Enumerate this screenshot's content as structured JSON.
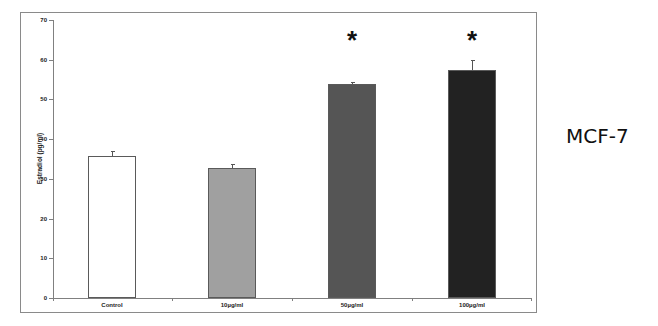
{
  "chart_data": {
    "type": "bar",
    "title": "",
    "xlabel": "",
    "ylabel": "Estradiol (pg/ml)",
    "ylim": [
      0,
      70
    ],
    "yticks": [
      0,
      10,
      20,
      30,
      40,
      50,
      60,
      70
    ],
    "grid": false,
    "categories": [
      "Control",
      "10µg/ml",
      "50µg/ml",
      "100µg/ml"
    ],
    "values": [
      35.8,
      32.7,
      53.8,
      57.4
    ],
    "error": [
      1.2,
      1.0,
      0.5,
      2.6
    ],
    "colors": [
      "#ffffff",
      "#a0a0a0",
      "#555555",
      "#222222"
    ],
    "significance": [
      "",
      "",
      "*",
      "*"
    ],
    "annotation": "MCF-7"
  },
  "labels": {
    "yaxis_title": "Estradiol (pg/ml)",
    "side_label": "MCF-7",
    "star": "*"
  }
}
